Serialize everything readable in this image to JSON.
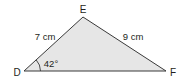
{
  "diagram": {
    "type": "triangle",
    "vertices": {
      "D": {
        "label": "D"
      },
      "E": {
        "label": "E"
      },
      "F": {
        "label": "F"
      }
    },
    "sides": {
      "DE": {
        "label": "7 cm"
      },
      "EF": {
        "label": "9 cm"
      }
    },
    "angles": {
      "D": {
        "label": "42°"
      }
    },
    "colors": {
      "fill": "#e6e6e6",
      "stroke": "#3a3a3a",
      "text": "#231f20"
    }
  }
}
